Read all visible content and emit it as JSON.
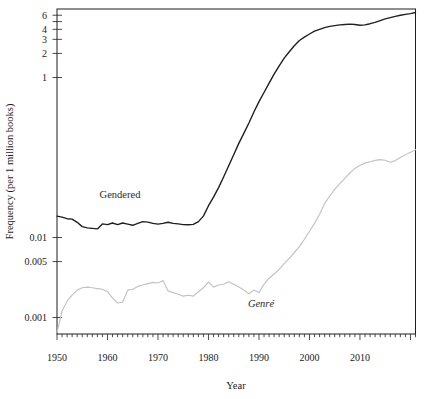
{
  "chart_data": {
    "type": "line",
    "title": "",
    "xlabel": "Year",
    "ylabel": "Frequency (per 1 million books)",
    "y_scale": "log",
    "x_scale": "linear",
    "xlim": [
      1950,
      2021
    ],
    "ylim": [
      0.00063,
      7.2
    ],
    "grid": false,
    "legend": "inline labels beside lines",
    "frame_color": "#1f1f1f",
    "x_major_ticks": [
      1950,
      1960,
      1970,
      1980,
      1990,
      2000,
      2010
    ],
    "x_minor_tick_every_years": 1,
    "y_tick_labels": [
      {
        "value": 6,
        "label": "6"
      },
      {
        "value": 5,
        "label": ""
      },
      {
        "value": 4,
        "label": "4"
      },
      {
        "value": 3,
        "label": "3"
      },
      {
        "value": 2,
        "label": "2"
      },
      {
        "value": 1,
        "label": "1"
      },
      {
        "value": 0.01,
        "label": "0.01"
      },
      {
        "value": 0.005,
        "label": "0.005"
      },
      {
        "value": 0.001,
        "label": "0.001"
      }
    ],
    "x": [
      1950,
      1951,
      1952,
      1953,
      1954,
      1955,
      1956,
      1957,
      1958,
      1959,
      1960,
      1961,
      1962,
      1963,
      1964,
      1965,
      1966,
      1967,
      1968,
      1969,
      1970,
      1971,
      1972,
      1973,
      1974,
      1975,
      1976,
      1977,
      1978,
      1979,
      1980,
      1981,
      1982,
      1983,
      1984,
      1985,
      1986,
      1987,
      1988,
      1989,
      1990,
      1991,
      1992,
      1993,
      1994,
      1995,
      1996,
      1997,
      1998,
      1999,
      2000,
      2001,
      2002,
      2003,
      2004,
      2005,
      2006,
      2007,
      2008,
      2009,
      2010,
      2011,
      2012,
      2013,
      2014,
      2015,
      2016,
      2017,
      2018,
      2019,
      2020,
      2021
    ],
    "series": [
      {
        "name": "Gendered",
        "color": "#1f1f1f",
        "style": "solid",
        "values": [
          0.0185,
          0.018,
          0.0172,
          0.017,
          0.0155,
          0.0137,
          0.0132,
          0.013,
          0.0128,
          0.0148,
          0.0145,
          0.0152,
          0.0145,
          0.0152,
          0.0147,
          0.0142,
          0.015,
          0.0158,
          0.0156,
          0.015,
          0.0147,
          0.015,
          0.0155,
          0.015,
          0.0148,
          0.0145,
          0.0144,
          0.0146,
          0.0158,
          0.0185,
          0.025,
          0.032,
          0.042,
          0.057,
          0.079,
          0.108,
          0.15,
          0.2,
          0.27,
          0.37,
          0.5,
          0.65,
          0.85,
          1.1,
          1.4,
          1.75,
          2.1,
          2.5,
          2.9,
          3.2,
          3.5,
          3.8,
          4.0,
          4.2,
          4.35,
          4.45,
          4.55,
          4.6,
          4.65,
          4.6,
          4.5,
          4.55,
          4.7,
          4.9,
          5.15,
          5.4,
          5.6,
          5.8,
          6.0,
          6.15,
          6.3,
          6.5
        ]
      },
      {
        "name": "Genré",
        "color": "#c2c2c2",
        "style": "solid",
        "values": [
          0.00065,
          0.0012,
          0.0016,
          0.0019,
          0.0022,
          0.00235,
          0.0024,
          0.00235,
          0.0023,
          0.00225,
          0.0021,
          0.00175,
          0.00152,
          0.00155,
          0.0022,
          0.00225,
          0.00245,
          0.00255,
          0.00265,
          0.00275,
          0.0027,
          0.0029,
          0.00215,
          0.00205,
          0.00195,
          0.00185,
          0.0019,
          0.00185,
          0.0021,
          0.00235,
          0.00278,
          0.0024,
          0.00255,
          0.0026,
          0.0028,
          0.0026,
          0.0024,
          0.0022,
          0.00198,
          0.0022,
          0.00205,
          0.0026,
          0.0031,
          0.0035,
          0.004,
          0.0047,
          0.0055,
          0.0065,
          0.0077,
          0.0095,
          0.012,
          0.015,
          0.0195,
          0.0265,
          0.033,
          0.04,
          0.047,
          0.055,
          0.064,
          0.073,
          0.08,
          0.085,
          0.0885,
          0.092,
          0.094,
          0.0925,
          0.087,
          0.0915,
          0.1,
          0.108,
          0.116,
          0.125
        ]
      }
    ]
  }
}
